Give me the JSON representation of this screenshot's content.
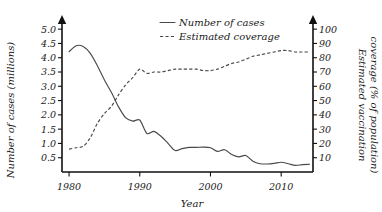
{
  "chart_data": {
    "type": "line",
    "title": "",
    "xlabel": "Year",
    "ylabel": "Number of cases (millions)",
    "y2label_line1": "Estimated vaccination",
    "y2label_line2": "coverage (% of population)",
    "xlim": [
      1979,
      2014.5
    ],
    "ylim": [
      0,
      5.25
    ],
    "y2lim": [
      0,
      105
    ],
    "grid": false,
    "legend_position": "top-center",
    "x_ticks": [
      1980,
      1990,
      2000,
      2010
    ],
    "x_tick_labels": [
      "1980",
      "1990",
      "2000",
      "2010"
    ],
    "y_ticks": [
      0.5,
      1.0,
      1.5,
      2.0,
      2.5,
      3.0,
      3.5,
      4.0,
      4.5,
      5.0
    ],
    "y_tick_labels": [
      "0.5",
      "1.0",
      "1.5",
      "2.0",
      "2.5",
      "3.0",
      "3.5",
      "4.0",
      "4.5",
      "5.0"
    ],
    "y2_ticks": [
      10,
      20,
      30,
      40,
      50,
      60,
      70,
      80,
      90,
      100
    ],
    "y2_tick_labels": [
      "10",
      "20",
      "30",
      "40",
      "50",
      "60",
      "70",
      "80",
      "90",
      "100"
    ],
    "series": [
      {
        "name": "Number of cases",
        "style": "solid",
        "axis": "left",
        "units": "millions",
        "x": [
          1980,
          1981,
          1982,
          1983,
          1984,
          1985,
          1986,
          1987,
          1988,
          1989,
          1990,
          1991,
          1992,
          1993,
          1994,
          1995,
          1996,
          1997,
          1998,
          1999,
          2000,
          2001,
          2002,
          2003,
          2004,
          2005,
          2006,
          2007,
          2008,
          2009,
          2010,
          2011,
          2012,
          2013,
          2014
        ],
        "values": [
          4.21,
          4.42,
          4.39,
          4.15,
          3.72,
          3.22,
          2.78,
          2.28,
          1.9,
          1.78,
          1.82,
          1.35,
          1.42,
          1.25,
          1.0,
          0.75,
          0.82,
          0.86,
          0.86,
          0.87,
          0.85,
          0.72,
          0.78,
          0.61,
          0.53,
          0.58,
          0.38,
          0.29,
          0.28,
          0.3,
          0.34,
          0.29,
          0.23,
          0.26,
          0.27
        ]
      },
      {
        "name": "Estimated coverage",
        "style": "dashed",
        "axis": "right",
        "units": "% of population",
        "x": [
          1980,
          1981,
          1982,
          1983,
          1984,
          1985,
          1986,
          1987,
          1988,
          1989,
          1990,
          1991,
          1992,
          1993,
          1994,
          1995,
          1996,
          1997,
          1998,
          1999,
          2000,
          2001,
          2002,
          2003,
          2004,
          2005,
          2006,
          2007,
          2008,
          2009,
          2010,
          2011,
          2012,
          2013,
          2014
        ],
        "values": [
          16,
          17,
          18,
          24,
          34,
          41,
          46,
          54,
          61,
          66,
          72,
          69,
          70,
          70,
          71,
          72,
          72,
          72,
          72,
          71,
          71,
          72,
          74,
          76,
          77,
          79,
          81,
          82,
          83,
          84,
          85,
          85,
          84,
          84,
          84
        ]
      }
    ],
    "legend": [
      {
        "label": "Number of cases",
        "style": "solid"
      },
      {
        "label": "Estimated coverage",
        "style": "dashed"
      }
    ]
  }
}
